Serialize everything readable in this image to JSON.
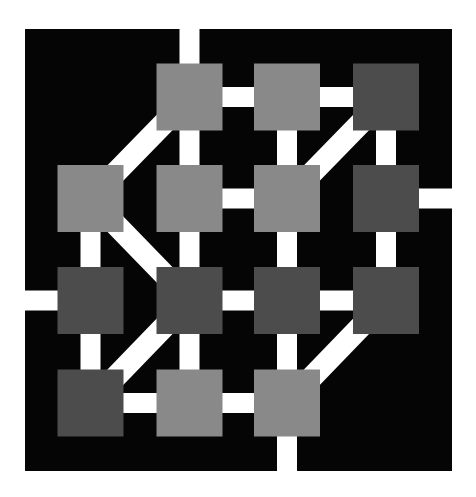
{
  "diagram": {
    "title": "",
    "type": "grid-graph-maze",
    "colors": {
      "background": "#ffffff",
      "board": "#050505",
      "path": "#ffffff",
      "light": "#898989",
      "dark": "#4c4c4c"
    },
    "grid": {
      "rows": 4,
      "cols": 4
    },
    "nodes": [
      {
        "id": "r1c2",
        "row": 1,
        "col": 2,
        "shade": "light"
      },
      {
        "id": "r1c3",
        "row": 1,
        "col": 3,
        "shade": "light"
      },
      {
        "id": "r1c4",
        "row": 1,
        "col": 4,
        "shade": "dark"
      },
      {
        "id": "r2c1",
        "row": 2,
        "col": 1,
        "shade": "light"
      },
      {
        "id": "r2c2",
        "row": 2,
        "col": 2,
        "shade": "light"
      },
      {
        "id": "r2c3",
        "row": 2,
        "col": 3,
        "shade": "light"
      },
      {
        "id": "r2c4",
        "row": 2,
        "col": 4,
        "shade": "dark"
      },
      {
        "id": "r3c1",
        "row": 3,
        "col": 1,
        "shade": "dark"
      },
      {
        "id": "r3c2",
        "row": 3,
        "col": 2,
        "shade": "dark"
      },
      {
        "id": "r3c3",
        "row": 3,
        "col": 3,
        "shade": "dark"
      },
      {
        "id": "r3c4",
        "row": 3,
        "col": 4,
        "shade": "dark"
      },
      {
        "id": "r4c1",
        "row": 4,
        "col": 1,
        "shade": "dark"
      },
      {
        "id": "r4c2",
        "row": 4,
        "col": 2,
        "shade": "light"
      },
      {
        "id": "r4c3",
        "row": 4,
        "col": 3,
        "shade": "light"
      }
    ],
    "edges": [
      [
        "r1c2",
        "r1c3"
      ],
      [
        "r1c3",
        "r1c4"
      ],
      [
        "r1c2",
        "r2c2"
      ],
      [
        "r1c3",
        "r2c3"
      ],
      [
        "r1c4",
        "r2c4"
      ],
      [
        "r1c2",
        "r2c1"
      ],
      [
        "r1c4",
        "r2c3"
      ],
      [
        "r2c2",
        "r2c3"
      ],
      [
        "r2c1",
        "r3c1"
      ],
      [
        "r2c2",
        "r3c2"
      ],
      [
        "r2c3",
        "r3c3"
      ],
      [
        "r2c4",
        "r3c4"
      ],
      [
        "r2c1",
        "r3c2"
      ],
      [
        "r3c2",
        "r3c3"
      ],
      [
        "r3c3",
        "r3c4"
      ],
      [
        "r3c1",
        "r4c1"
      ],
      [
        "r3c2",
        "r4c2"
      ],
      [
        "r3c3",
        "r4c3"
      ],
      [
        "r3c2",
        "r4c1"
      ],
      [
        "r3c4",
        "r4c3"
      ],
      [
        "r4c1",
        "r4c2"
      ],
      [
        "r4c2",
        "r4c3"
      ]
    ],
    "exits": [
      {
        "node": "r1c2",
        "side": "top"
      },
      {
        "node": "r2c4",
        "side": "right"
      },
      {
        "node": "r3c1",
        "side": "left"
      },
      {
        "node": "r4c3",
        "side": "bottom"
      }
    ]
  }
}
